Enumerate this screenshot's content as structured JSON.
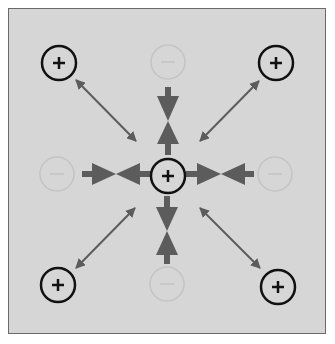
{
  "diagram": {
    "colors": {
      "background": "#d6d6d6",
      "border": "#6a6a6a",
      "positive_ring": "#111111",
      "negative_ring": "#c4c4c4",
      "arrow": "#5c5c5c"
    },
    "center_charge": {
      "sign": "+",
      "x": 168,
      "y": 176
    },
    "positive_charges": [
      {
        "sign": "+",
        "label": "top-left",
        "x": 59,
        "y": 63
      },
      {
        "sign": "+",
        "label": "top-right",
        "x": 276,
        "y": 63
      },
      {
        "sign": "+",
        "label": "bottom-left",
        "x": 58,
        "y": 285
      },
      {
        "sign": "+",
        "label": "bottom-right",
        "x": 278,
        "y": 287
      }
    ],
    "negative_charges": [
      {
        "sign": "−",
        "label": "top",
        "x": 168,
        "y": 62
      },
      {
        "sign": "−",
        "label": "left",
        "x": 57,
        "y": 174
      },
      {
        "sign": "−",
        "label": "right",
        "x": 275,
        "y": 174
      },
      {
        "sign": "−",
        "label": "bottom",
        "x": 167,
        "y": 284
      }
    ]
  }
}
